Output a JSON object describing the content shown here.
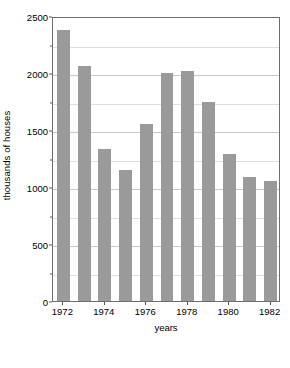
{
  "chart_data": {
    "type": "bar",
    "title": "",
    "xlabel": "years",
    "ylabel": "thousands of houses",
    "categories": [
      1972,
      1973,
      1974,
      1975,
      1976,
      1977,
      1978,
      1979,
      1980,
      1981,
      1982
    ],
    "values": [
      2380,
      2060,
      1330,
      1150,
      1550,
      2000,
      2020,
      1750,
      1290,
      1090,
      1050
    ],
    "series": [
      {
        "name": "houses",
        "values": [
          2380,
          2060,
          1330,
          1150,
          1550,
          2000,
          2020,
          1750,
          1290,
          1090,
          1050
        ]
      }
    ],
    "ylim": [
      0,
      2500
    ],
    "y_major_ticks": [
      0,
      500,
      1000,
      1500,
      2000,
      2500
    ],
    "y_major_tick_labels": [
      "0",
      "500",
      "1000",
      "1500",
      "2000",
      "2500"
    ],
    "y_minor_ticks": [
      250,
      750,
      1250,
      1750,
      2250
    ],
    "x_tick_labels": [
      "1972",
      "1974",
      "1976",
      "1978",
      "1980",
      "1982"
    ],
    "x_tick_values": [
      1972,
      1974,
      1976,
      1978,
      1980,
      1982
    ],
    "grid": true,
    "grid_axis": "y",
    "legend": false,
    "legend_position": "none",
    "bar_color": "#9a9a9a",
    "plot_border_color": "#6e6e6e",
    "grid_color": "#c9c9c9",
    "background_color": "#ffffff",
    "text_color": "#000000"
  }
}
